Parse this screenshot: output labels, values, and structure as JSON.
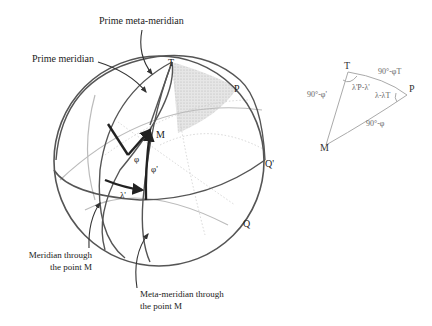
{
  "callouts": {
    "prime_meta_meridian": "Prime meta-meridian",
    "prime_meridian": "Prime meridian",
    "meridian_through_m": [
      "Meridian through",
      "the point M"
    ],
    "meta_meridian_through_m": [
      "Meta-meridian through",
      "the point M"
    ]
  },
  "sphere_points": {
    "T": "T",
    "P": "P",
    "M": "M",
    "Q_prime": "Q'",
    "Q": "Q"
  },
  "sphere_angles": {
    "phi": "φ",
    "phi_prime": "φ'",
    "lambda_prime": "λ'"
  },
  "triangle": {
    "vertices": {
      "T": "T",
      "P": "P",
      "M": "M"
    },
    "sides": {
      "TP": "90°-φT",
      "TM": "90°-φ'",
      "PM": "90°-φ"
    },
    "angles": {
      "at_T": "λ'P-λ'",
      "at_P": "λ-λT"
    }
  },
  "colors": {
    "stroke": "#555555",
    "faint": "#bbbbbb",
    "shade": "#d8d8d8",
    "text": "#222222"
  }
}
